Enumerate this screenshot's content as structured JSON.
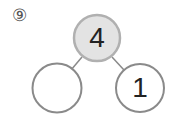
{
  "problem": {
    "number_label": "⑨"
  },
  "number_bond": {
    "whole": "4",
    "part_left": "",
    "part_right": "1"
  },
  "colors": {
    "whole_fill": "#e3e3e3",
    "whole_stroke": "#b0b0b0",
    "part_stroke": "#8a8a8a",
    "line": "#8a8a8a",
    "text": "#222222"
  }
}
